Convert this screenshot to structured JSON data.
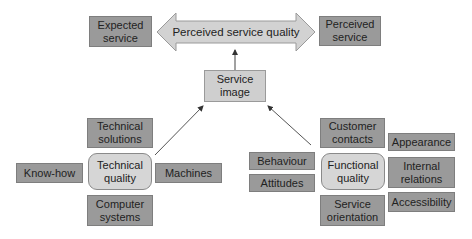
{
  "diagram": {
    "title": "",
    "top_row": {
      "expected_service": "Expected service",
      "perceived_service_quality": "Perceived service quality",
      "perceived_service": "Perceived service"
    },
    "service_image": "Service image",
    "technical": {
      "center": "Technical quality",
      "top": "Technical solutions",
      "left": "Know-how",
      "right": "Machines",
      "bottom": "Computer systems"
    },
    "functional": {
      "center": "Functional quality",
      "top": "Customer contacts",
      "bottom": "Service orientation",
      "left": [
        "Behaviour",
        "Attitudes"
      ],
      "right": [
        "Appearance",
        "Internal relations",
        "Accessibility"
      ]
    },
    "colors": {
      "dark_box": "#9a9a9a",
      "light_box": "#cfcfcf",
      "rounded_box": "#d6d6d6",
      "arrow_fill": "#d2d2d2",
      "line": "#444444"
    }
  }
}
